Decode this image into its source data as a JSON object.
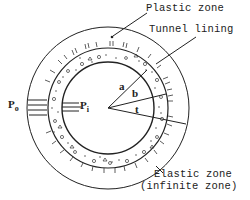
{
  "diagram": {
    "labels": {
      "plastic_zone": "Plastic zone",
      "tunnel_lining": "Tunnel lining",
      "elastic_zone": "Elastic zone",
      "elastic_zone_note": "(infinite zone)",
      "outer_pressure": "P",
      "outer_pressure_sub": "o",
      "inner_pressure": "P",
      "inner_pressure_sub": "i",
      "radius_a": "a",
      "radius_b": "b",
      "radius_t": "t"
    },
    "geometry": {
      "center": [
        108,
        108
      ],
      "inner_radius_a": 46,
      "lining_outer_radius_b": 60,
      "plastic_zone_radius": 81
    },
    "colors": {
      "line": "#222222",
      "background": "#ffffff"
    }
  }
}
